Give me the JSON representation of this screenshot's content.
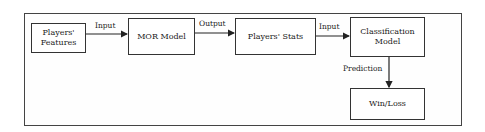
{
  "diagram": {
    "nodes": {
      "players_features": "Players'\nFeatures",
      "mor_model": "MOR Model",
      "players_stats": "Players' Stats",
      "classification_model": "Classification\nModel",
      "win_loss": "Win/Loss"
    },
    "edges": {
      "features_to_mor": "Input",
      "mor_to_stats": "Output",
      "stats_to_classification": "Input",
      "classification_to_winloss": "Prediction"
    }
  }
}
